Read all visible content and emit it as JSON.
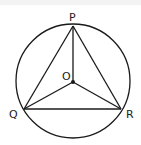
{
  "diagram": {
    "type": "circle-inscribed-triangle",
    "labels": {
      "P": "P",
      "Q": "Q",
      "R": "R",
      "O": "O"
    },
    "points": {
      "P": [
        73,
        26
      ],
      "Q": [
        24,
        109
      ],
      "R": [
        121,
        109
      ],
      "O": [
        73,
        82
      ]
    },
    "circle": {
      "cx": 73,
      "cy": 81,
      "r": 57
    },
    "stroke_color": "#1a1a1a"
  }
}
